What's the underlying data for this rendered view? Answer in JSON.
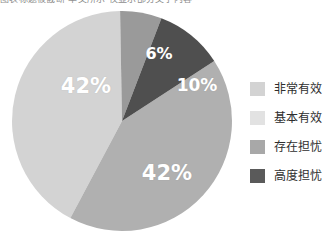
{
  "caption": {
    "clipped_text": "图表标题被截断 本文所示 仅显示部分文字内容"
  },
  "legend": {
    "position": "right",
    "items": [
      {
        "label": "非常有效",
        "color": "#d3d3d3",
        "swatch_name": "legend-swatch-very-effective"
      },
      {
        "label": "基本有效",
        "color": "#e2e2e2",
        "swatch_name": "legend-swatch-basically-effective"
      },
      {
        "label": "存在担忧",
        "color": "#a8a8a8",
        "swatch_name": "legend-swatch-some-concern"
      },
      {
        "label": "高度担忧",
        "color": "#5a5a5a",
        "swatch_name": "legend-swatch-high-concern"
      }
    ]
  },
  "chart_data": {
    "type": "pie",
    "title": "",
    "legend_position": "right",
    "grid": false,
    "labels_shown": true,
    "label_format": "percent",
    "categories": [
      "非常有效",
      "基本有效",
      "存在担忧",
      "高度担忧"
    ],
    "values": [
      42,
      42,
      6,
      10
    ],
    "value_labels": [
      "42%",
      "42%",
      "6%",
      "10%"
    ],
    "colors": [
      "#d3d3d3",
      "#b0b0b0",
      "#9a9a9a",
      "#4f4f4f"
    ],
    "total": 100,
    "geometry": {
      "center_x": 111,
      "center_y": 111,
      "radius": 110,
      "start_angle_deg": -8,
      "direction": "clockwise"
    },
    "slices": [
      {
        "name": "非常有效",
        "value": 42,
        "label": "42%",
        "color": "#d3d3d3",
        "start_deg": 208,
        "end_deg": 359
      },
      {
        "name": "基本有效",
        "value": 42,
        "label": "42%",
        "color": "#b0b0b0",
        "start_deg": 57,
        "end_deg": 208
      },
      {
        "name": "存在担忧",
        "value": 6,
        "label": "6%",
        "color": "#9a9a9a",
        "start_deg": 359,
        "end_deg": 381
      },
      {
        "name": "高度担忧",
        "value": 10,
        "label": "10%",
        "color": "#4f4f4f",
        "start_deg": 381,
        "end_deg": 417
      }
    ]
  }
}
